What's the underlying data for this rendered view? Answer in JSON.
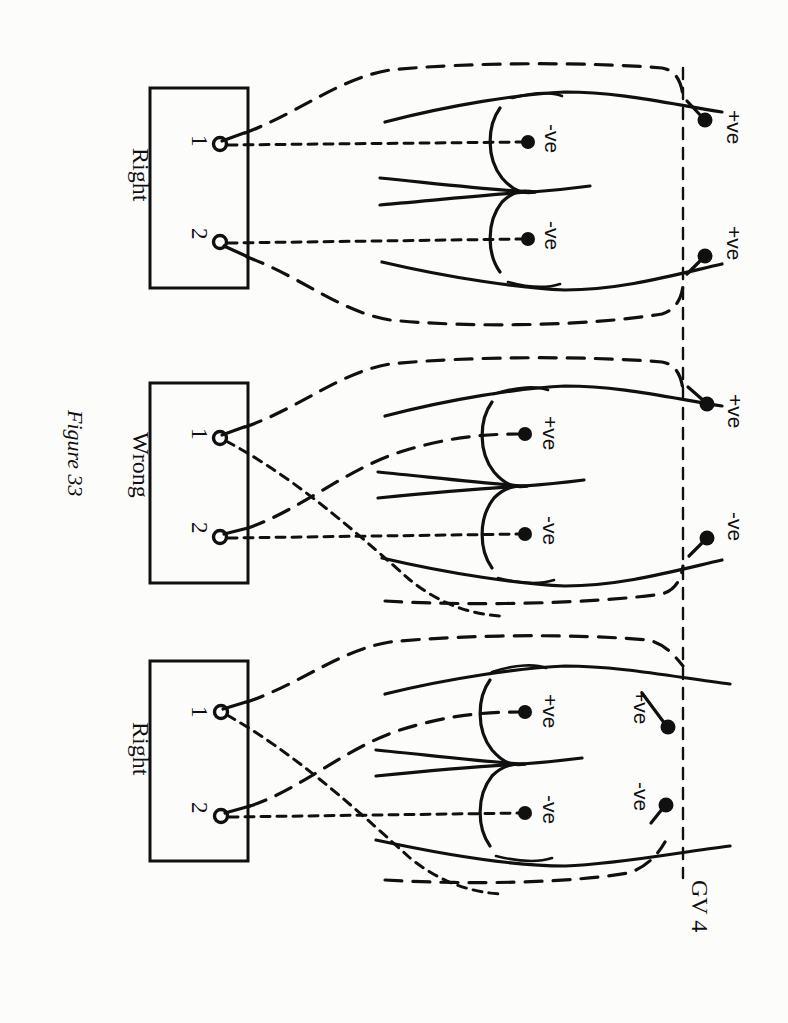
{
  "figure": {
    "caption": "Figure 33",
    "orientation": "rotated-90-clockwise",
    "background_color": "#fcfcfb",
    "ink_color": "#101010"
  },
  "global_labels": {
    "reference_line": "GV 4"
  },
  "panels": [
    {
      "id": "panel-top",
      "verdict": "Right",
      "terminal_block": {
        "terminals": [
          {
            "number": "1"
          },
          {
            "number": "2"
          }
        ]
      },
      "inner_electrodes": [
        {
          "label": "-ve",
          "position": "upper"
        },
        {
          "label": "-ve",
          "position": "lower"
        }
      ],
      "outer_electrodes": [
        {
          "label": "+ve",
          "position": "upper"
        },
        {
          "label": "+ve",
          "position": "lower"
        }
      ],
      "wires_crossed": false
    },
    {
      "id": "panel-middle",
      "verdict": "Wrong",
      "terminal_block": {
        "terminals": [
          {
            "number": "1"
          },
          {
            "number": "2"
          }
        ]
      },
      "inner_electrodes": [
        {
          "label": "+ve",
          "position": "upper"
        },
        {
          "label": "-ve",
          "position": "lower"
        }
      ],
      "outer_electrodes": [
        {
          "label": "+ve",
          "position": "upper"
        },
        {
          "label": "-ve",
          "position": "lower"
        }
      ],
      "wires_crossed": true
    },
    {
      "id": "panel-bottom",
      "verdict": "Right",
      "terminal_block": {
        "terminals": [
          {
            "number": "1"
          },
          {
            "number": "2"
          }
        ]
      },
      "inner_electrodes": [
        {
          "label": "+ve",
          "position": "upper"
        },
        {
          "label": "-ve",
          "position": "lower"
        }
      ],
      "outer_electrodes": [
        {
          "label": "+ve",
          "position": "upper"
        },
        {
          "label": "-ve",
          "position": "lower"
        }
      ],
      "wires_crossed": true
    }
  ]
}
